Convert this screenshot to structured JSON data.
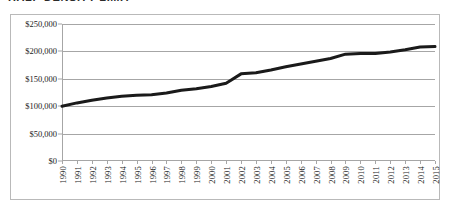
{
  "title": "HALF-DENSITY LIMIT",
  "chart_data": {
    "type": "line",
    "title": "HALF-DENSITY LIMIT",
    "xlabel": "",
    "ylabel": "",
    "grid": true,
    "legend": false,
    "xlim": [
      1990,
      2015
    ],
    "ylim": [
      0,
      250000
    ],
    "ytick_labels": [
      "$0",
      "$50,000",
      "$100,000",
      "$150,000",
      "$200,000",
      "$250,000"
    ],
    "ytick_values": [
      0,
      50000,
      100000,
      150000,
      200000,
      250000
    ],
    "categories": [
      "1990",
      "1991",
      "1992",
      "1993",
      "1994",
      "1995",
      "1996",
      "1997",
      "1998",
      "1999",
      "2000",
      "2001",
      "2002",
      "2003",
      "2004",
      "2005",
      "2006",
      "2007",
      "2008",
      "2009",
      "2010",
      "2011",
      "2012",
      "2013",
      "2014",
      "2015"
    ],
    "series": [
      {
        "name": "Value",
        "color": "#1a1a1a",
        "values": [
          100000,
          106000,
          111000,
          115000,
          118000,
          120000,
          121000,
          124000,
          129000,
          132000,
          136000,
          142000,
          159000,
          161000,
          166000,
          172000,
          177000,
          182000,
          187000,
          195000,
          196000,
          196000,
          199000,
          203000,
          208000,
          209000
        ]
      }
    ]
  },
  "style": {
    "line_color": "#1a1a1a",
    "grid_color": "#a6a6a6",
    "frame_color": "#b9b9b9",
    "background": "#ffffff"
  }
}
